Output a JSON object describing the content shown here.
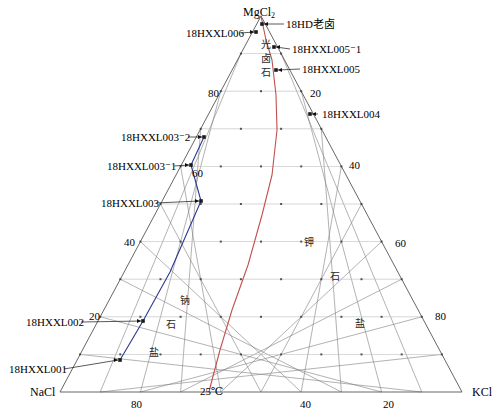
{
  "chart_data": {
    "type": "scatter",
    "title": "",
    "subtitle": "",
    "diagram_kind": "ternary-phase-diagram",
    "temperature_label": "25℃",
    "corners": {
      "top": "MgCl2",
      "top_display": "MgCl",
      "top_subscript": "2",
      "bottom_left": "NaCl",
      "bottom_right": "KCl"
    },
    "axes": {
      "left": {
        "name": "MgCl2 → NaCl",
        "ticks": [
          20,
          40,
          60,
          80
        ],
        "visible_ticks": [
          "80",
          "60",
          "40",
          "20"
        ],
        "range": [
          0,
          100
        ],
        "grid": true
      },
      "right": {
        "name": "MgCl2 → KCl",
        "ticks": [
          20,
          40,
          60,
          80
        ],
        "visible_ticks": [
          "20",
          "40",
          "60",
          "80"
        ],
        "range": [
          0,
          100
        ],
        "grid": true
      },
      "bottom": {
        "name": "NaCl → KCl",
        "ticks": [
          20,
          40,
          80
        ],
        "visible_ticks": [
          "80",
          "40",
          "20"
        ],
        "range": [
          0,
          100
        ],
        "grid": true
      }
    },
    "grid_interval": 10,
    "fields": [
      {
        "label": "光卤石",
        "meaning": "carnallite",
        "orientation": "vertical",
        "x": 263,
        "y": 45
      },
      {
        "label": "钠石盐",
        "meaning": "halite",
        "orientation": "diagonal",
        "x": 175,
        "y": 300
      },
      {
        "label": "钾石盐",
        "meaning": "sylvite",
        "orientation": "diagonal",
        "x": 308,
        "y": 240
      }
    ],
    "field_chars": {
      "carnallite": [
        "光",
        "卤",
        "石"
      ],
      "halite": [
        "钠",
        "石",
        "盐"
      ],
      "sylvite": [
        "钾",
        "石",
        "盐"
      ]
    },
    "sample_points": [
      {
        "label": "18HD老卤",
        "px": 262,
        "py": 24,
        "side": "right",
        "label_x": 286,
        "label_y": 19
      },
      {
        "label": "18HXXL006",
        "px": 256,
        "py": 32,
        "side": "left",
        "label_x": 186,
        "label_y": 28
      },
      {
        "label": "18HXXL005⁻1",
        "px": 274,
        "py": 47,
        "side": "right",
        "label_x": 292,
        "label_y": 44
      },
      {
        "label": "18HXXL005",
        "px": 276,
        "py": 70,
        "side": "right",
        "label_x": 302,
        "label_y": 64
      },
      {
        "label": "18HXXL004",
        "px": 310,
        "py": 114,
        "side": "right",
        "label_x": 320,
        "label_y": 109
      },
      {
        "label": "18HXXL003⁻2",
        "px": 204,
        "py": 137,
        "side": "left",
        "label_x": 121,
        "label_y": 132
      },
      {
        "label": "18HXXL003⁻1",
        "px": 191,
        "py": 165,
        "side": "left",
        "label_x": 107,
        "label_y": 161
      },
      {
        "label": "18HXXL003",
        "px": 201,
        "py": 201,
        "side": "left",
        "label_x": 101,
        "label_y": 198
      },
      {
        "label": "18HXXL002",
        "px": 143,
        "py": 321,
        "side": "left",
        "label_x": 26,
        "label_y": 317
      },
      {
        "label": "18HXXL001",
        "px": 120,
        "py": 360,
        "side": "left",
        "label_x": 9,
        "label_y": 364
      }
    ],
    "curves": [
      {
        "name": "phase-boundary-red",
        "color": "#c0504d",
        "description": "25℃ solubility / crystallization path",
        "points": [
          [
            261,
            16
          ],
          [
            266,
            40
          ],
          [
            272,
            60
          ],
          [
            276,
            95
          ],
          [
            277,
            130
          ],
          [
            272,
            175
          ],
          [
            262,
            215
          ],
          [
            248,
            265
          ],
          [
            232,
            310
          ],
          [
            220,
            350
          ],
          [
            212,
            380
          ],
          [
            209,
            392
          ]
        ]
      },
      {
        "name": "sample-path-blue",
        "color": "#2b3a8f",
        "description": "connecting line through brine samples",
        "points": [
          [
            204,
            137
          ],
          [
            191,
            165
          ],
          [
            201,
            201
          ],
          [
            170,
            272
          ],
          [
            143,
            321
          ],
          [
            120,
            360
          ]
        ]
      }
    ],
    "colors": {
      "grid": "#808080",
      "horizontal_grid": "#bfbfbf",
      "red_curve": "#c0504d",
      "blue_curve": "#2b3a8f",
      "text": "#000000",
      "point": "#1a1a1a",
      "outline": "#555555"
    }
  },
  "corners": {
    "top_main": "MgCl",
    "top_sub": "2",
    "bottom_left": "NaCl",
    "bottom_right": "KCl"
  },
  "ticks": {
    "left_80": "80",
    "left_60": "60",
    "left_40": "40",
    "left_20": "20",
    "right_20": "20",
    "right_40": "40",
    "right_60": "60",
    "right_80": "80",
    "bottom_80": "80",
    "bottom_40": "40",
    "bottom_20": "20"
  },
  "temperature": {
    "value": "25℃"
  },
  "fields": {
    "carnallite_1": "光",
    "carnallite_2": "卤",
    "carnallite_3": "石",
    "halite_1": "钠",
    "halite_2": "石",
    "halite_3": "盐",
    "sylvite_1": "钾",
    "sylvite_2": "石",
    "sylvite_3": "盐"
  },
  "samples": {
    "hd_laolu": "18HD老卤",
    "l006": "18HXXL006",
    "l005_1": "18HXXL005⁻1",
    "l005": "18HXXL005",
    "l004": "18HXXL004",
    "l003_2": "18HXXL003⁻2",
    "l003_1": "18HXXL003⁻1",
    "l003": "18HXXL003",
    "l002": "18HXXL002",
    "l001": "18HXXL001"
  }
}
